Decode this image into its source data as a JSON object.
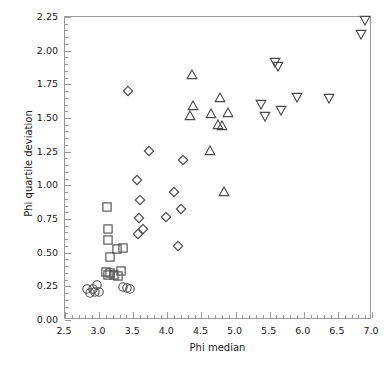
{
  "chart_data": {
    "type": "scatter",
    "title": "",
    "xlabel": "Phi median",
    "ylabel": "Phi quartile deviation",
    "xlim": [
      2.5,
      7.0
    ],
    "ylim": [
      0.0,
      2.25
    ],
    "grid": false,
    "legend_position": "none",
    "xticks": [
      2.5,
      3.0,
      3.5,
      4.0,
      4.5,
      5.0,
      5.5,
      6.0,
      6.5,
      7.0
    ],
    "xtick_labels": [
      "2.5",
      "3.0",
      "3.5",
      "4.0",
      "4.5",
      "5.0",
      "5.5",
      "6.0",
      "6.5",
      "7.0"
    ],
    "xminor_step": 0.1,
    "yticks": [
      0.0,
      0.25,
      0.5,
      0.75,
      1.0,
      1.25,
      1.5,
      1.75,
      2.0,
      2.25
    ],
    "ytick_labels": [
      "0.00",
      "0.25",
      "0.50",
      "0.75",
      "1.00",
      "1.25",
      "1.50",
      "1.75",
      "2.00",
      "2.25"
    ],
    "yminor_step": 0.05,
    "marker_color": "#4a4a4a",
    "frame_color": "#9a9a9a",
    "series": [
      {
        "name": "circle-group",
        "marker": "circle",
        "points": [
          [
            2.83,
            0.22
          ],
          [
            2.88,
            0.19
          ],
          [
            2.92,
            0.22
          ],
          [
            2.95,
            0.2
          ],
          [
            2.99,
            0.25
          ],
          [
            3.02,
            0.2
          ],
          [
            3.37,
            0.24
          ],
          [
            3.43,
            0.23
          ],
          [
            3.47,
            0.22
          ]
        ]
      },
      {
        "name": "square-group",
        "marker": "square",
        "points": [
          [
            3.13,
            0.83
          ],
          [
            3.14,
            0.67
          ],
          [
            3.14,
            0.59
          ],
          [
            3.18,
            0.46
          ],
          [
            3.28,
            0.52
          ],
          [
            3.37,
            0.53
          ],
          [
            3.11,
            0.35
          ],
          [
            3.14,
            0.33
          ],
          [
            3.18,
            0.34
          ],
          [
            3.24,
            0.33
          ],
          [
            3.29,
            0.32
          ],
          [
            3.33,
            0.36
          ]
        ]
      },
      {
        "name": "diamond-group",
        "marker": "diamond",
        "points": [
          [
            3.44,
            1.69
          ],
          [
            3.74,
            1.25
          ],
          [
            3.57,
            1.03
          ],
          [
            3.62,
            0.88
          ],
          [
            3.6,
            0.75
          ],
          [
            3.59,
            0.63
          ],
          [
            3.66,
            0.67
          ],
          [
            3.99,
            0.76
          ],
          [
            4.11,
            0.94
          ],
          [
            4.22,
            0.82
          ],
          [
            4.24,
            1.18
          ],
          [
            4.17,
            0.54
          ]
        ]
      },
      {
        "name": "up-triangle-group",
        "marker": "triangle-up",
        "points": [
          [
            4.37,
            1.81
          ],
          [
            4.39,
            1.58
          ],
          [
            4.34,
            1.51
          ],
          [
            4.66,
            1.52
          ],
          [
            4.79,
            1.64
          ],
          [
            4.9,
            1.53
          ],
          [
            4.75,
            1.44
          ],
          [
            4.82,
            1.43
          ],
          [
            4.64,
            1.25
          ],
          [
            4.85,
            0.94
          ]
        ]
      },
      {
        "name": "down-triangle-group",
        "marker": "triangle-down",
        "points": [
          [
            5.59,
            1.91
          ],
          [
            5.63,
            1.88
          ],
          [
            5.39,
            1.6
          ],
          [
            5.44,
            1.51
          ],
          [
            5.68,
            1.55
          ],
          [
            5.92,
            1.65
          ],
          [
            6.39,
            1.64
          ],
          [
            6.91,
            2.22
          ],
          [
            6.86,
            2.12
          ]
        ]
      }
    ]
  },
  "axes": {
    "x_title": "Phi median",
    "y_title": "Phi quartile deviation"
  }
}
